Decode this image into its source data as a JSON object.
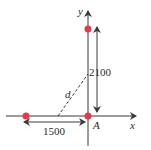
{
  "diagram": {
    "axes": {
      "x_label": "x",
      "y_label": "y"
    },
    "points": [
      {
        "name": "top-point",
        "color": "#e23b4a"
      },
      {
        "name": "left-point",
        "color": "#e23b4a"
      },
      {
        "name": "origin-point",
        "label": "A",
        "color": "#e23b4a"
      }
    ],
    "dimensions": {
      "vertical": "2100",
      "horizontal": "1500",
      "diagonal": "d"
    },
    "colors": {
      "axis": "#3a3a3a",
      "point": "#e23b4a",
      "text": "#2b2b2b"
    }
  }
}
